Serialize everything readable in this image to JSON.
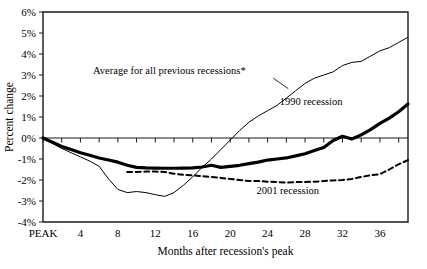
{
  "chart_data": {
    "type": "line",
    "title": "",
    "xlabel": "Months after recession's peak",
    "ylabel": "Percent change",
    "xlim": [
      0,
      39
    ],
    "ylim": [
      -4,
      6
    ],
    "grid": false,
    "legend_position": "inline-annotations",
    "y_ticks": [
      "6%",
      "5%",
      "4%",
      "3%",
      "2%",
      "1%",
      "0%",
      "-1%",
      "-2%",
      "-3%",
      "-4%"
    ],
    "y_tick_values": [
      6,
      5,
      4,
      3,
      2,
      1,
      0,
      -1,
      -2,
      -3,
      -4
    ],
    "x_ticks": [
      "PEAK",
      "4",
      "8",
      "12",
      "16",
      "20",
      "24",
      "28",
      "32",
      "36"
    ],
    "x_tick_values": [
      0,
      4,
      8,
      12,
      16,
      20,
      24,
      28,
      32,
      36
    ],
    "annotations": [
      {
        "text": "Average for all previous recessions*",
        "x": 13.5,
        "y": 3.05
      },
      {
        "text": "1990 recession",
        "x": 32.0,
        "y": 1.55
      },
      {
        "text": "2001 recession",
        "x": 29.5,
        "y": -2.65
      }
    ],
    "series": [
      {
        "name": "Average for all previous recessions*",
        "style": "thin-solid",
        "color": "#000000",
        "width": 1,
        "x": [
          0,
          1,
          2,
          3,
          4,
          5,
          6,
          7,
          8,
          9,
          10,
          11,
          12,
          13,
          14,
          15,
          16,
          17,
          18,
          19,
          20,
          21,
          22,
          23,
          24,
          25,
          26,
          27,
          28,
          29,
          30,
          31,
          32,
          33,
          34,
          35,
          36,
          37,
          38,
          39
        ],
        "values": [
          0.0,
          -0.25,
          -0.5,
          -0.7,
          -0.9,
          -1.1,
          -1.35,
          -1.95,
          -2.45,
          -2.6,
          -2.55,
          -2.6,
          -2.7,
          -2.78,
          -2.6,
          -2.25,
          -1.85,
          -1.4,
          -1.0,
          -0.55,
          -0.1,
          0.35,
          0.75,
          1.05,
          1.3,
          1.55,
          1.9,
          2.25,
          2.6,
          2.85,
          3.0,
          3.15,
          3.45,
          3.6,
          3.65,
          3.9,
          4.15,
          4.3,
          4.55,
          4.8
        ]
      },
      {
        "name": "1990 recession",
        "style": "thick-solid",
        "color": "#000000",
        "width": 3.2,
        "x": [
          0,
          1,
          2,
          3,
          4,
          5,
          6,
          7,
          8,
          9,
          10,
          11,
          12,
          13,
          14,
          15,
          16,
          17,
          18,
          19,
          20,
          21,
          22,
          23,
          24,
          25,
          26,
          27,
          28,
          29,
          30,
          31,
          32,
          33,
          34,
          35,
          36,
          37,
          38,
          39
        ],
        "values": [
          0.0,
          -0.2,
          -0.4,
          -0.55,
          -0.7,
          -0.82,
          -0.95,
          -1.05,
          -1.15,
          -1.3,
          -1.4,
          -1.42,
          -1.43,
          -1.44,
          -1.44,
          -1.43,
          -1.42,
          -1.38,
          -1.3,
          -1.4,
          -1.35,
          -1.3,
          -1.22,
          -1.15,
          -1.05,
          -1.0,
          -0.95,
          -0.85,
          -0.75,
          -0.6,
          -0.45,
          -0.12,
          0.08,
          -0.05,
          0.15,
          0.4,
          0.7,
          0.95,
          1.25,
          1.62
        ]
      },
      {
        "name": "2001 recession",
        "style": "dashed",
        "color": "#000000",
        "width": 2,
        "x": [
          9,
          10,
          11,
          12,
          13,
          14,
          15,
          16,
          17,
          18,
          19,
          20,
          21,
          22,
          23,
          24,
          25,
          26,
          27,
          28,
          29,
          30,
          31,
          32,
          33,
          34,
          35,
          36,
          37,
          38,
          39
        ],
        "values": [
          -1.62,
          -1.62,
          -1.6,
          -1.6,
          -1.62,
          -1.7,
          -1.75,
          -1.78,
          -1.82,
          -1.85,
          -1.9,
          -1.95,
          -2.0,
          -2.05,
          -2.05,
          -2.08,
          -2.1,
          -2.12,
          -2.1,
          -2.1,
          -2.08,
          -2.05,
          -2.02,
          -2.0,
          -1.95,
          -1.85,
          -1.78,
          -1.72,
          -1.5,
          -1.25,
          -1.05
        ]
      }
    ]
  }
}
